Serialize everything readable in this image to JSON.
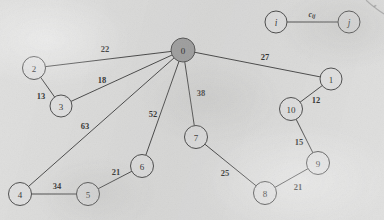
{
  "figure": {
    "kind": "undirected-weighted-graph",
    "background_color": "#dcdcdb",
    "edge_color": "#3a3a3a",
    "node_fill": "#dedede",
    "root_node_fill": "#9c9c9c"
  },
  "legend": {
    "left_node_label": "i",
    "right_node_label": "j",
    "edge_label_base": "c",
    "edge_label_sub": "ij",
    "left_node": {
      "cx": 276,
      "cy": 22,
      "r": 11
    },
    "right_node": {
      "cx": 349,
      "cy": 22,
      "r": 11
    },
    "edge_label_pos": {
      "x": 312,
      "y": 14
    }
  },
  "nodes": [
    {
      "id": "0",
      "label": "0",
      "cx": 183,
      "cy": 50,
      "r": 12,
      "root": true
    },
    {
      "id": "1",
      "label": "1",
      "cx": 331,
      "cy": 79,
      "r": 11,
      "root": false
    },
    {
      "id": "2",
      "label": "2",
      "cx": 34,
      "cy": 68,
      "r": 11.5,
      "root": false
    },
    {
      "id": "3",
      "label": "3",
      "cx": 61,
      "cy": 106,
      "r": 11,
      "root": false
    },
    {
      "id": "4",
      "label": "4",
      "cx": 20,
      "cy": 194,
      "r": 11.5,
      "root": false
    },
    {
      "id": "5",
      "label": "5",
      "cx": 88,
      "cy": 194,
      "r": 11.5,
      "root": false
    },
    {
      "id": "6",
      "label": "6",
      "cx": 142,
      "cy": 166,
      "r": 11.5,
      "root": false
    },
    {
      "id": "7",
      "label": "7",
      "cx": 196,
      "cy": 137,
      "r": 11.5,
      "root": false
    },
    {
      "id": "8",
      "label": "8",
      "cx": 265,
      "cy": 193,
      "r": 11.5,
      "root": false
    },
    {
      "id": "9",
      "label": "9",
      "cx": 318,
      "cy": 163,
      "r": 11.5,
      "root": false
    },
    {
      "id": "10",
      "label": "10",
      "cx": 291,
      "cy": 109,
      "r": 11.5,
      "root": false
    }
  ],
  "edges": [
    {
      "from": "2",
      "to": "0",
      "weight": "22",
      "label_pos": {
        "x": 105,
        "y": 49
      }
    },
    {
      "from": "3",
      "to": "0",
      "weight": "18",
      "label_pos": {
        "x": 102,
        "y": 80
      }
    },
    {
      "from": "2",
      "to": "3",
      "weight": "13",
      "label_pos": {
        "x": 41,
        "y": 96
      }
    },
    {
      "from": "4",
      "to": "0",
      "weight": "63",
      "label_pos": {
        "x": 85,
        "y": 126
      }
    },
    {
      "from": "4",
      "to": "5",
      "weight": "34",
      "label_pos": {
        "x": 57,
        "y": 186
      }
    },
    {
      "from": "5",
      "to": "6",
      "weight": "21",
      "label_pos": {
        "x": 116,
        "y": 172
      }
    },
    {
      "from": "6",
      "to": "0",
      "weight": "52",
      "label_pos": {
        "x": 153,
        "y": 114
      }
    },
    {
      "from": "7",
      "to": "0",
      "weight": "38",
      "label_pos": {
        "x": 201,
        "y": 93
      }
    },
    {
      "from": "7",
      "to": "8",
      "weight": "25",
      "label_pos": {
        "x": 225,
        "y": 173
      }
    },
    {
      "from": "8",
      "to": "9",
      "weight": "21",
      "label_pos": {
        "x": 298,
        "y": 187
      }
    },
    {
      "from": "9",
      "to": "10",
      "weight": "15",
      "label_pos": {
        "x": 299,
        "y": 142
      }
    },
    {
      "from": "10",
      "to": "1",
      "weight": "12",
      "label_pos": {
        "x": 316,
        "y": 100
      }
    },
    {
      "from": "1",
      "to": "0",
      "weight": "27",
      "label_pos": {
        "x": 265,
        "y": 57
      }
    }
  ]
}
